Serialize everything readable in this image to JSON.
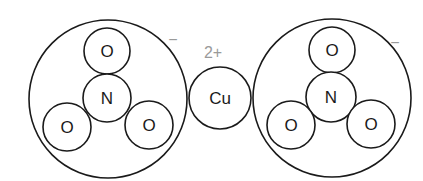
{
  "diagram": {
    "colors": {
      "stroke": "#1a1a1a",
      "charge": "#9a9a9a",
      "background": "#ffffff"
    },
    "left_ion": {
      "name": "nitrate",
      "charge": "−",
      "center_atom": "N",
      "top_atom": "O",
      "bottom_left_atom": "O",
      "bottom_right_atom": "O"
    },
    "cation": {
      "name": "copper",
      "symbol": "Cu",
      "charge": "2+"
    },
    "right_ion": {
      "name": "nitrate",
      "charge": "−",
      "center_atom": "N",
      "top_atom": "O",
      "bottom_left_atom": "O",
      "bottom_right_atom": "O"
    }
  }
}
